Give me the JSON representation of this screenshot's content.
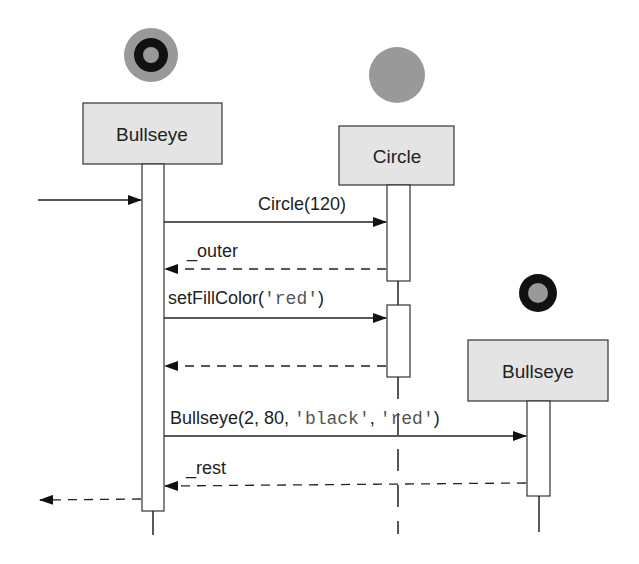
{
  "diagram": {
    "type": "sequence",
    "colors": {
      "box_fill": "#e4e4e4",
      "box_stroke": "#333333",
      "line": "#222222",
      "circle_gray": "#999999",
      "circle_black": "#111111",
      "mono_text": "#555555"
    },
    "participants": [
      {
        "id": "bullseye1",
        "label": "Bullseye",
        "icon": "bullseye-gray-outer-icon"
      },
      {
        "id": "circle",
        "label": "Circle",
        "icon": "gray-circle-icon"
      },
      {
        "id": "bullseye2",
        "label": "Bullseye",
        "icon": "bullseye-black-outer-icon"
      }
    ],
    "messages": [
      {
        "from": "external",
        "to": "bullseye1",
        "kind": "call",
        "label": ""
      },
      {
        "from": "bullseye1",
        "to": "circle",
        "kind": "call",
        "label": "Circle(120)"
      },
      {
        "from": "circle",
        "to": "bullseye1",
        "kind": "return",
        "label": "_outer"
      },
      {
        "from": "bullseye1",
        "to": "circle",
        "kind": "call",
        "label_prefix": "setFillColor(",
        "label_mono": "'red'",
        "label_suffix": ")"
      },
      {
        "from": "circle",
        "to": "bullseye1",
        "kind": "return",
        "label": ""
      },
      {
        "from": "bullseye1",
        "to": "bullseye2",
        "kind": "call",
        "label_prefix": "Bullseye(2, 80, ",
        "label_mono1": "'black'",
        "label_sep": ", ",
        "label_mono2": "'red'",
        "label_suffix": ")"
      },
      {
        "from": "bullseye2",
        "to": "bullseye1",
        "kind": "return",
        "label": "_rest"
      },
      {
        "from": "bullseye1",
        "to": "external",
        "kind": "return",
        "label": ""
      }
    ]
  }
}
